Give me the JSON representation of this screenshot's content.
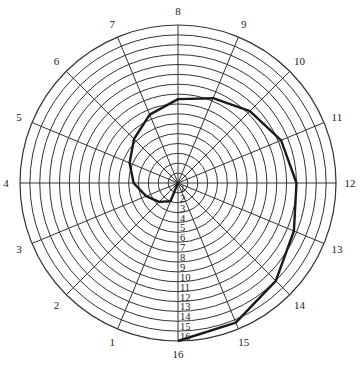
{
  "chart_data": {
    "type": "polar-line",
    "title": "",
    "spoke_labels": [
      "16",
      "1",
      "2",
      "3",
      "4",
      "5",
      "6",
      "7",
      "8",
      "9",
      "10",
      "11",
      "12",
      "13",
      "14",
      "15"
    ],
    "ring_labels": [
      "1",
      "2",
      "3",
      "4",
      "5",
      "6",
      "7",
      "8",
      "9",
      "10",
      "11",
      "12",
      "13",
      "14",
      "15",
      "16"
    ],
    "bottom_label": "16",
    "rings": 16,
    "spokes": 16,
    "series": [
      {
        "name": "spiral",
        "points": [
          {
            "spoke": 0,
            "r": 0
          },
          {
            "spoke": 1,
            "r": 2.0
          },
          {
            "spoke": 2,
            "r": 2.7
          },
          {
            "spoke": 3,
            "r": 3.5
          },
          {
            "spoke": 4,
            "r": 4.5
          },
          {
            "spoke": 5,
            "r": 5.3
          },
          {
            "spoke": 6,
            "r": 6.3
          },
          {
            "spoke": 7,
            "r": 7.5
          },
          {
            "spoke": 8,
            "r": 8.5
          },
          {
            "spoke": 9,
            "r": 9.3
          },
          {
            "spoke": 10,
            "r": 10.3
          },
          {
            "spoke": 11,
            "r": 11.3
          },
          {
            "spoke": 12,
            "r": 12.0
          },
          {
            "spoke": 13,
            "r": 12.7
          },
          {
            "spoke": 14,
            "r": 14.0
          },
          {
            "spoke": 15,
            "r": 15.3
          },
          {
            "spoke": 16,
            "r": 16.0
          }
        ]
      }
    ],
    "colors": {
      "grid": "#333333",
      "curve": "#1a1a1a",
      "background": "#ffffff"
    }
  }
}
